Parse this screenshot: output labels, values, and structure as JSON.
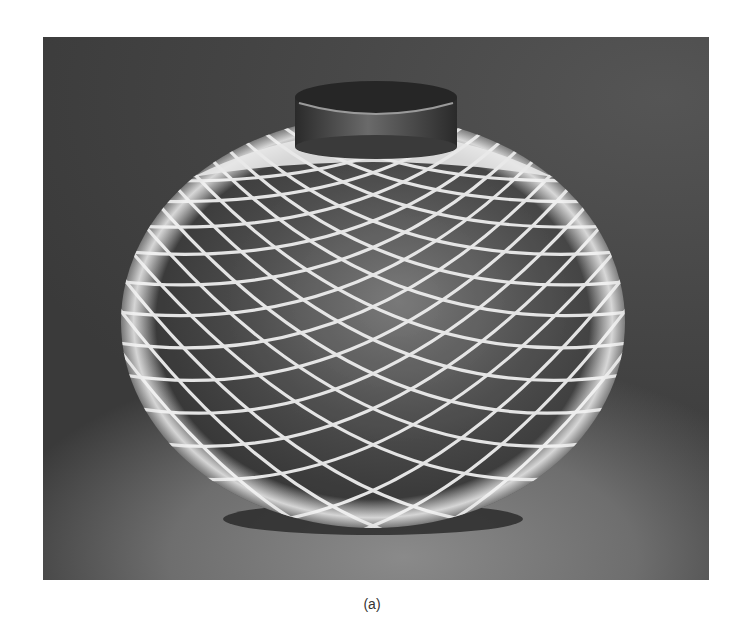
{
  "figure": {
    "caption": "(a)",
    "colors": {
      "background": "#474747",
      "floor": "#7a7a7a",
      "filament": "#efefef",
      "vessel_interior": "#3c3c3c",
      "boss": "#2f2f2f",
      "page": "#ffffff"
    }
  }
}
